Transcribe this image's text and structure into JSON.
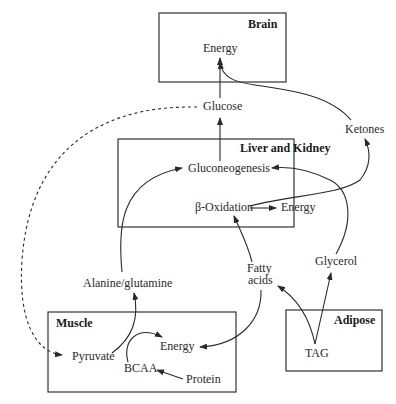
{
  "compartments": {
    "brain": {
      "title": "Brain",
      "nodes": {
        "energy": "Energy"
      }
    },
    "liver": {
      "title": "Liver and Kidney",
      "nodes": {
        "gluconeogenesis": "Gluconeogenesis",
        "beta_oxidation": "β-Oxidation",
        "energy": "Energy"
      }
    },
    "muscle": {
      "title": "Muscle",
      "nodes": {
        "pyruvate": "Pyruvate",
        "energy": "Energy",
        "bcaa": "BCAA",
        "protein": "Protein"
      }
    },
    "adipose": {
      "title": "Adipose",
      "nodes": {
        "tag": "TAG"
      }
    }
  },
  "free_nodes": {
    "glucose": "Glucose",
    "ketones": "Ketones",
    "alanine_glutamine": "Alanine/glutamine",
    "fatty_acids_line1": "Fatty",
    "fatty_acids_line2": "acids",
    "glycerol": "Glycerol"
  }
}
